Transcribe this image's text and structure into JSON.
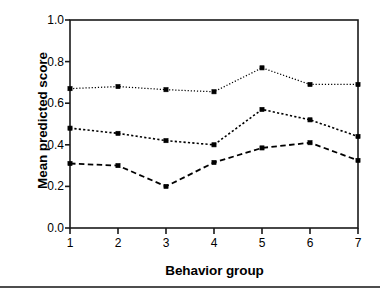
{
  "chart_data": {
    "type": "line",
    "title": "",
    "xlabel": "Behavior group",
    "ylabel": "Mean predicted score",
    "categories": [
      "1",
      "2",
      "3",
      "4",
      "5",
      "6",
      "7"
    ],
    "x": [
      1,
      2,
      3,
      4,
      5,
      6,
      7
    ],
    "xlim": [
      1,
      7
    ],
    "ylim": [
      0.0,
      1.0
    ],
    "yticks": [
      "1.0",
      "0.8",
      "0.6",
      "0.4",
      "0.2",
      "0.0"
    ],
    "ytick_values": [
      1.0,
      0.8,
      0.6,
      0.4,
      0.2,
      0.0
    ],
    "xticks": [
      "1",
      "2",
      "3",
      "4",
      "5",
      "6",
      "7"
    ],
    "grid": false,
    "legend": "none",
    "marker": "square",
    "color": "#000000",
    "series": [
      {
        "name": "upper",
        "style": "dotted",
        "values": [
          0.67,
          0.68,
          0.665,
          0.655,
          0.77,
          0.69,
          0.69
        ]
      },
      {
        "name": "middle",
        "style": "dotted-medium",
        "values": [
          0.48,
          0.455,
          0.42,
          0.4,
          0.57,
          0.52,
          0.44
        ]
      },
      {
        "name": "lower",
        "style": "dashed",
        "values": [
          0.31,
          0.3,
          0.2,
          0.315,
          0.385,
          0.41,
          0.325
        ]
      }
    ]
  },
  "figure": {
    "axis_color": "#1a1a1a",
    "background": "#ffffff",
    "rule_color": "#4d4d4d"
  }
}
